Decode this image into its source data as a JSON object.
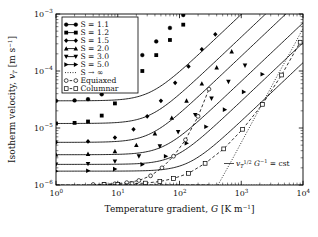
{
  "figure": {
    "title": "",
    "background": "#ffffff",
    "line_color": "#000000"
  },
  "axes": {
    "x": {
      "label_prefix": "Temperature gradient, ",
      "label_symbol": "G",
      "label_units": "[K m",
      "label_units_exp": "−1",
      "label_units_close": "]",
      "scale": "log",
      "min": 1,
      "max": 10000,
      "ticks": [
        {
          "value": 1,
          "mantissa": "10",
          "exponent": "0"
        },
        {
          "value": 10,
          "mantissa": "10",
          "exponent": "1"
        },
        {
          "value": 100,
          "mantissa": "10",
          "exponent": "2"
        },
        {
          "value": 1000,
          "mantissa": "10",
          "exponent": "3"
        },
        {
          "value": 10000,
          "mantissa": "10",
          "exponent": "4"
        }
      ]
    },
    "y": {
      "label_prefix": "Isotherm velocity, ",
      "label_symbol": "v",
      "label_symbol_sub": "T",
      "label_units": "[m s",
      "label_units_exp": "−1",
      "label_units_close": "]",
      "scale": "log",
      "min": 1e-06,
      "max": 0.001,
      "ticks": [
        {
          "value": 0.001,
          "mantissa": "10",
          "exponent": "−3"
        },
        {
          "value": 0.0001,
          "mantissa": "10",
          "exponent": "−4"
        },
        {
          "value": 1e-05,
          "mantissa": "10",
          "exponent": "−5"
        },
        {
          "value": 1e-06,
          "mantissa": "10",
          "exponent": "−6"
        }
      ]
    }
  },
  "legend": {
    "position": "top-left",
    "items": [
      {
        "label": "S = 1.1",
        "marker": "circle-filled",
        "line": "solid",
        "key": "s11"
      },
      {
        "label": "S = 1.2",
        "marker": "square-filled",
        "line": "solid",
        "key": "s12"
      },
      {
        "label": "S = 1.5",
        "marker": "diamond-filled",
        "line": "solid",
        "key": "s15"
      },
      {
        "label": "S = 2.0",
        "marker": "triangle-up-filled",
        "line": "solid",
        "key": "s20"
      },
      {
        "label": "S = 3.0",
        "marker": "triangle-down-filled",
        "line": "solid",
        "key": "s30"
      },
      {
        "label": "S = 5.0",
        "marker": "triangle-right-filled",
        "line": "solid",
        "key": "s50"
      },
      {
        "label": "S → ∞",
        "marker": "none",
        "line": "dotted",
        "key": "sinf"
      },
      {
        "label": "Equiaxed",
        "marker": "circle-open",
        "line": "dashed",
        "key": "equiaxed"
      },
      {
        "label": "Columnar",
        "marker": "square-open",
        "line": "dashed",
        "key": "columnar"
      }
    ]
  },
  "annotations": [
    {
      "name": "power-law-annotation",
      "text_parts": {
        "v": "v",
        "sub": "T",
        "sup": "1/2",
        "g": "G",
        "gexp": "−1",
        "eq": "= cst"
      },
      "full_text": "v_T^{1/2} G^{-1} = cst",
      "x_px": 240,
      "y_px": 166
    }
  ],
  "chart_data": {
    "type": "line",
    "title": "",
    "xlabel": "Temperature gradient, G [K m^-1]",
    "ylabel": "Isotherm velocity, v_T [m s^-1]",
    "xscale": "log",
    "yscale": "log",
    "xlim": [
      1,
      10000
    ],
    "ylim": [
      1e-06,
      0.001
    ],
    "grid": false,
    "legend_position": "upper left",
    "series": [
      {
        "name": "S = 1.1",
        "marker": "circle-filled",
        "linestyle": "solid",
        "plateau": 3e-05,
        "x": [
          1,
          2,
          3.3,
          5.5,
          9,
          15,
          25,
          42,
          70,
          115
        ],
        "y": [
          3e-05,
          3.05e-05,
          3.2e-05,
          3.9e-05,
          6e-05,
          0.000105,
          0.00019,
          0.00033,
          0.00057,
          0.00096
        ]
      },
      {
        "name": "S = 1.2",
        "marker": "square-filled",
        "linestyle": "solid",
        "plateau": 1.2e-05,
        "x": [
          1,
          2,
          3.3,
          5.5,
          9,
          15,
          25,
          42,
          70,
          115
        ],
        "y": [
          1.2e-05,
          1.23e-05,
          1.3e-05,
          1.65e-05,
          2.7e-05,
          5.2e-05,
          0.0001,
          0.00019,
          0.00035,
          0.00065
        ]
      },
      {
        "name": "S = 1.5",
        "marker": "diamond-filled",
        "linestyle": "solid",
        "plateau": 5.6e-06,
        "x": [
          1,
          3.3,
          9,
          18,
          30,
          50,
          85,
          140,
          230,
          380
        ],
        "y": [
          5.6e-06,
          5.8e-06,
          6.8e-06,
          9.5e-06,
          1.6e-05,
          3e-05,
          6.2e-05,
          0.00012,
          0.00024,
          0.00044
        ]
      },
      {
        "name": "S = 2.0",
        "marker": "triangle-up-filled",
        "linestyle": "solid",
        "plateau": 3.4e-06,
        "x": [
          1,
          3.3,
          9,
          20,
          40,
          75,
          130,
          230,
          400,
          700
        ],
        "y": [
          3.4e-06,
          3.5e-06,
          3.9e-06,
          5e-06,
          8e-06,
          1.5e-05,
          3e-05,
          6e-05,
          0.000115,
          0.00022
        ]
      },
      {
        "name": "S = 3.0",
        "marker": "triangle-down-filled",
        "linestyle": "solid",
        "plateau": 2.3e-06,
        "x": [
          1,
          3.3,
          9,
          22,
          48,
          95,
          180,
          330,
          620,
          1150
        ],
        "y": [
          2.3e-06,
          2.35e-06,
          2.6e-06,
          3.2e-06,
          4.8e-06,
          8.5e-06,
          1.7e-05,
          3.3e-05,
          6.5e-05,
          0.000125
        ]
      },
      {
        "name": "S = 5.0",
        "marker": "triangle-right-filled",
        "linestyle": "solid",
        "plateau": 1.75e-06,
        "x": [
          1,
          3.3,
          9,
          25,
          60,
          130,
          270,
          540,
          1100,
          2200
        ],
        "y": [
          1.75e-06,
          1.78e-06,
          1.9e-06,
          2.3e-06,
          3.2e-06,
          5.4e-06,
          1.05e-05,
          2.1e-05,
          4.3e-05,
          8.8e-05
        ]
      },
      {
        "name": "S → ∞",
        "marker": "none",
        "linestyle": "dotted",
        "comment": "asymptotic power law v_T^{1/2} G^{-1} = cst, rises from baseline near G=420",
        "x": [
          420,
          700,
          1200,
          2200,
          4000,
          7000,
          10000
        ],
        "y": [
          1e-06,
          2.7e-06,
          8e-06,
          2.7e-05,
          9e-05,
          0.00027,
          0.00056
        ]
      },
      {
        "name": "Equiaxed",
        "marker": "circle-open",
        "linestyle": "dashed",
        "x": [
          4,
          6,
          9,
          14,
          22,
          34,
          52,
          80,
          125,
          200,
          300
        ],
        "y": [
          1.02e-06,
          1.03e-06,
          1.05e-06,
          1.1e-06,
          1.2e-06,
          1.45e-06,
          2e-06,
          3.2e-06,
          6.2e-06,
          1.6e-05,
          4.8e-05
        ]
      },
      {
        "name": "Columnar",
        "marker": "square-open",
        "linestyle": "dashed",
        "x": [
          6,
          10,
          17,
          28,
          48,
          80,
          140,
          260,
          520,
          1050,
          2200,
          4500,
          9000
        ],
        "y": [
          1.02e-06,
          1.03e-06,
          1.05e-06,
          1.08e-06,
          1.15e-06,
          1.3e-06,
          1.6e-06,
          2.4e-06,
          4.3e-06,
          9.5e-06,
          2.6e-05,
          8.5e-05,
          0.00032
        ]
      }
    ]
  }
}
